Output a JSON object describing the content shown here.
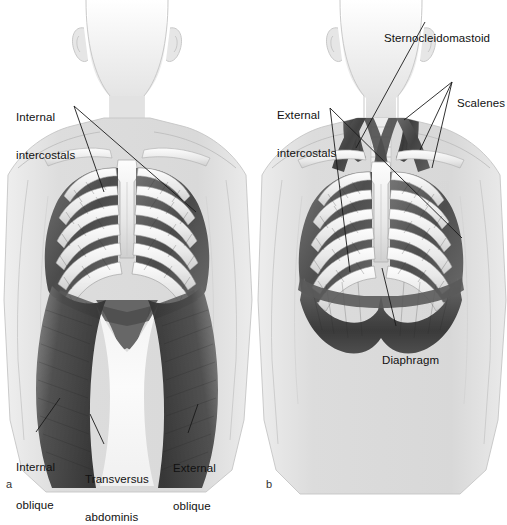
{
  "figure": {
    "background_color": "#ffffff",
    "body_fill_color": "#dcdcdc",
    "bone_color": "#f2f2f2",
    "muscle_dark_color": "#4f4f4f",
    "leader_line_color": "#1a1a1a",
    "panels": [
      {
        "id": "a",
        "marker": "a",
        "view": "anterior torso, deep layer",
        "labels": [
          {
            "name": "internal-intercostals",
            "lines": [
              "Internal",
              "intercostals"
            ],
            "x": 16,
            "y": 86
          },
          {
            "name": "internal-oblique",
            "lines": [
              "Internal",
              "oblique"
            ],
            "x": 16,
            "y": 436
          },
          {
            "name": "transversus-abdominis",
            "lines": [
              "Transversus",
              "abdominis"
            ],
            "x": 85,
            "y": 448
          },
          {
            "name": "external-oblique",
            "lines": [
              "External",
              "oblique"
            ],
            "x": 173,
            "y": 437
          }
        ]
      },
      {
        "id": "b",
        "marker": "b",
        "view": "anterior torso, superficial layer with neck muscles",
        "labels": [
          {
            "name": "sternocleidomastoid",
            "lines": [
              "Sternocleidomastoid"
            ],
            "x": 384,
            "y": 7
          },
          {
            "name": "scalenes",
            "lines": [
              "Scalenes"
            ],
            "x": 457,
            "y": 72
          },
          {
            "name": "external-intercostals",
            "lines": [
              "External",
              "intercostals"
            ],
            "x": 277,
            "y": 84
          },
          {
            "name": "diaphragm",
            "lines": [
              "Diaphragm"
            ],
            "x": 382,
            "y": 329
          }
        ]
      }
    ]
  }
}
